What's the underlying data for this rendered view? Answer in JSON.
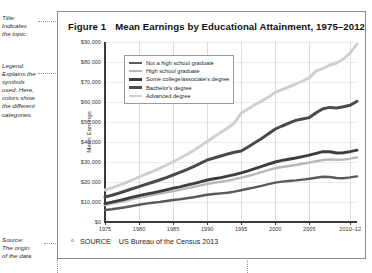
{
  "annotations": {
    "title_note": "Title: Indicates the topic.",
    "title_note_lines": [
      "Title:",
      "Indicates",
      "the topic."
    ],
    "legend_note_lines": [
      "Legend:",
      "Explains the",
      "symbols",
      "used. Here,",
      "colors show",
      "the different",
      "categories."
    ],
    "source_note_lines": [
      "Source:",
      "The origin",
      "of the data."
    ]
  },
  "figure": {
    "number_label": "Figure 1",
    "title": "Mean Earnings by Educational Attainment, 1975–2012",
    "source_keyword": "SOURCE",
    "source_text": "US Bureau of the Census 2013"
  },
  "chart_data": {
    "type": "line",
    "title": "Mean Earnings by Educational Attainment, 1975–2012",
    "xlabel": "",
    "ylabel": "Mean Earnings",
    "xlim": [
      1975,
      2012
    ],
    "ylim": [
      0,
      90000
    ],
    "grid": true,
    "legend_position": "top-left-inside",
    "ytick_labels": [
      "$0",
      "$10,000",
      "$20,000",
      "$30,000",
      "$40,000",
      "$50,000",
      "$60,000",
      "$70,000",
      "$80,000",
      "$90,000"
    ],
    "ytick_values": [
      0,
      10000,
      20000,
      30000,
      40000,
      50000,
      60000,
      70000,
      80000,
      90000
    ],
    "xtick_labels": [
      "1975",
      "1980",
      "1985",
      "1990",
      "1995",
      "2000",
      "2005",
      "2010–12"
    ],
    "xtick_values": [
      1975,
      1980,
      1985,
      1990,
      1995,
      2000,
      2005,
      2011
    ],
    "x": [
      1975,
      1976,
      1977,
      1978,
      1979,
      1980,
      1981,
      1982,
      1983,
      1984,
      1985,
      1986,
      1987,
      1988,
      1989,
      1990,
      1991,
      1992,
      1993,
      1994,
      1995,
      1996,
      1997,
      1998,
      1999,
      2000,
      2001,
      2002,
      2003,
      2004,
      2005,
      2006,
      2007,
      2008,
      2009,
      2010,
      2011,
      2012
    ],
    "series": [
      {
        "name": "Not a high school graduate",
        "color": "#5a5a5a",
        "width": 2.4,
        "values": [
          6000,
          6400,
          6900,
          7400,
          8000,
          8600,
          9200,
          9600,
          10000,
          10500,
          11000,
          11400,
          11900,
          12400,
          13000,
          13600,
          14000,
          14300,
          14600,
          15200,
          15900,
          16600,
          17300,
          18100,
          18900,
          19700,
          20200,
          20500,
          20800,
          21200,
          21600,
          22100,
          22600,
          22500,
          22000,
          21900,
          22300,
          22800
        ]
      },
      {
        "name": "High school graduate",
        "color": "#b8b8b8",
        "width": 2.4,
        "values": [
          8500,
          9200,
          9900,
          10600,
          11400,
          12200,
          12900,
          13500,
          14100,
          14800,
          15500,
          16100,
          16800,
          17500,
          18300,
          19000,
          19600,
          20100,
          20700,
          21400,
          22200,
          23000,
          23900,
          24900,
          25900,
          26900,
          27500,
          28000,
          28500,
          29100,
          29700,
          30400,
          31000,
          31300,
          31100,
          31200,
          31700,
          32300
        ]
      },
      {
        "name": "Some college/associate's degree",
        "color": "#3d3d3d",
        "width": 2.9,
        "values": [
          9200,
          9900,
          10700,
          11500,
          12400,
          13200,
          13900,
          14600,
          15300,
          16100,
          16900,
          17600,
          18400,
          19200,
          20100,
          21000,
          21600,
          22200,
          22900,
          23700,
          24600,
          25600,
          26700,
          27800,
          28900,
          30000,
          30800,
          31400,
          32000,
          32700,
          33400,
          34300,
          35200,
          35100,
          34500,
          34600,
          35200,
          35900
        ]
      },
      {
        "name": "Bachelor's degree",
        "color": "#4a4a4a",
        "width": 3.0,
        "values": [
          12500,
          13400,
          14400,
          15500,
          16600,
          17700,
          18800,
          19900,
          21000,
          22200,
          23500,
          24800,
          26200,
          27700,
          29300,
          31000,
          32000,
          33000,
          34000,
          34900,
          35500,
          37500,
          39600,
          41800,
          44100,
          46500,
          48000,
          49400,
          50800,
          51500,
          52200,
          54600,
          56600,
          57300,
          57000,
          57600,
          58400,
          60400
        ]
      },
      {
        "name": "Advanced degree",
        "color": "#cfcfcf",
        "width": 2.9,
        "values": [
          16000,
          17100,
          18300,
          19600,
          21000,
          22500,
          23900,
          25300,
          26800,
          28400,
          30100,
          31900,
          33800,
          35800,
          38000,
          40300,
          42500,
          44800,
          47000,
          49500,
          54500,
          56500,
          58600,
          60500,
          62500,
          64800,
          66200,
          67600,
          69000,
          70500,
          72000,
          75500,
          76800,
          78500,
          79500,
          81500,
          84500,
          89000
        ]
      }
    ]
  }
}
